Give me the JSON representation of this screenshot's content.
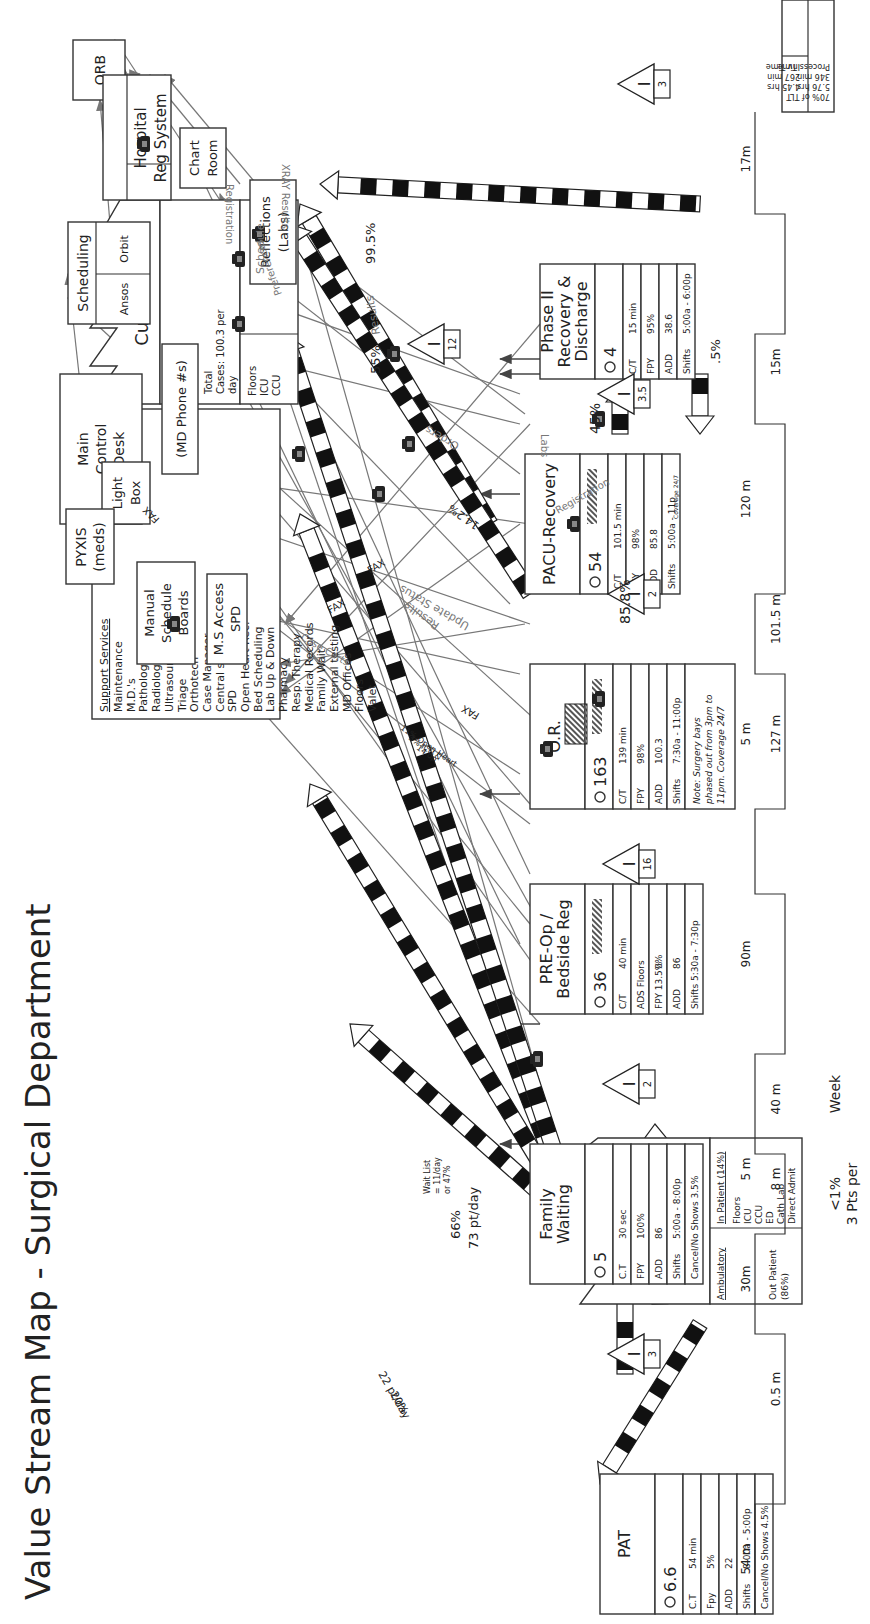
{
  "title": "Value Stream Map - Surgical Department",
  "suppliers": {
    "label": "Suppliers",
    "ambulatory": {
      "heading": "Ambulatory",
      "lines": [
        "Out Patient",
        "(86%)"
      ]
    },
    "inpatient": {
      "heading": "In Patient (14%)",
      "lines": [
        "Floors",
        "ICU",
        "CCU",
        "ED",
        "Cath Lab",
        "Direct Admit"
      ]
    },
    "note_lines": [
      "<1%",
      "3 Pts per",
      "Week"
    ]
  },
  "customer": {
    "label": "Customer",
    "total_lines": [
      "Total",
      "Cases: 100.3 per",
      "day"
    ],
    "home": "Home",
    "floors_lines": [
      "Floors",
      "ICU",
      "CCU"
    ]
  },
  "info_systems": {
    "orb": "ORB",
    "scheduling": "Scheduling",
    "orbit": "Orbit",
    "ansos": "Ansos",
    "main_control_lines": [
      "Main",
      "Control",
      "Desk"
    ],
    "light_box_lines": [
      "Light",
      "Box"
    ],
    "pyxis_lines": [
      "PYXIS",
      "(meds)"
    ],
    "manual_boards_lines": [
      "Manual",
      "Schedule",
      "Boards"
    ],
    "ms_access_lines": [
      "M.S Access",
      "SPD"
    ],
    "md_phone": "(MD Phone #s)",
    "hospital_reg_lines": [
      "Hospital",
      "Reg System"
    ],
    "chart_room_lines": [
      "Chart",
      "Room"
    ],
    "reflections_lines": [
      "Reflections",
      "(Labs)"
    ]
  },
  "support_services": {
    "heading": "Support Services",
    "items": [
      "Maintenance",
      "M.D.'s",
      "Pathology",
      "Radiology",
      "Ultrasound",
      "Triage",
      "Orthotech",
      "Case Manager",
      "Central supply",
      "SPD",
      "Open Heart Rec.",
      "Bed Scheduling",
      "Lab Up & Down",
      "Pharmacy",
      "Resp. Therapy",
      "Medical Records",
      "Family Wait",
      "External testing",
      "MD Offices",
      "Floors",
      "Valet"
    ]
  },
  "flow_labels": {
    "registration_1": "Registration",
    "registration_2": "Registration",
    "xray_results": "XRAY Results",
    "labs": "Labs",
    "preferences": "Preferences",
    "schedule": "Schedule",
    "results_1": "Results",
    "results_2": "Results",
    "orders": "Orders",
    "update_status": "Update Status",
    "case_carts": "Case Carts",
    "fax_1": "FAX",
    "fax_2": "FAX",
    "fax_3": "FAX",
    "fax_4": "FAX",
    "open_heart_note": [
      "11% Open Heart",
      "3% ICU &",
      "14 dp"
    ]
  },
  "material_flow": {
    "pat_pct": "20%",
    "pat_rate": "22 pt/day",
    "family_pct": "66%",
    "family_rate": "73 pt/day",
    "wait_list": [
      "Wait List",
      "= 11/day",
      "or 47%"
    ],
    "or_to_pacu_pct": "85.8%",
    "or_to_customer_pct": "14.2%",
    "pacu_to_phase2_pct": "45%",
    "pacu_to_customer_pct": "55%",
    "phase2_back_pct": ".5%",
    "phase2_to_customer_pct": "99.5%"
  },
  "inventory": [
    {
      "name": "inv-suppliers-pat",
      "value": "3"
    },
    {
      "name": "inv-family-preop",
      "value": "2"
    },
    {
      "name": "inv-preop-or",
      "value": "16"
    },
    {
      "name": "inv-or-pacu",
      "value": "2"
    },
    {
      "name": "inv-pacu-phase2",
      "value": "3.5"
    },
    {
      "name": "inv-pacu-customer",
      "value": "12"
    },
    {
      "name": "inv-phase2-customer",
      "value": "3"
    }
  ],
  "processes": [
    {
      "id": "pat",
      "name_lines": [
        "PAT"
      ],
      "operators": "6.6",
      "rows": [
        [
          "C.T",
          "54 min"
        ],
        [
          "Fpy",
          "5%"
        ],
        [
          "ADD",
          "22"
        ],
        [
          "Shifts",
          "8:00a - 5:00p"
        ],
        [
          "Cancel/No Shows 4.5%",
          ""
        ]
      ]
    },
    {
      "id": "family",
      "name_lines": [
        "Family",
        "Waiting"
      ],
      "operators": "5",
      "rows": [
        [
          "C.T",
          "30 sec"
        ],
        [
          "FPY",
          "100%"
        ],
        [
          "ADD",
          "86"
        ],
        [
          "Shifts",
          "5:00a - 8:00p"
        ],
        [
          "Cancel/No Shows 3.5%",
          ""
        ]
      ]
    },
    {
      "id": "preop",
      "name_lines": [
        "PRE-Op /",
        "Bedside Reg"
      ],
      "operators": "36",
      "rows": [
        [
          "C/T",
          "40 min"
        ],
        [
          "ADS  Floors",
          ""
        ],
        [
          "FPY  13.5%",
          "0%"
        ],
        [
          "ADD",
          "86"
        ],
        [
          "Shifts 5:30a - 7:30p",
          ""
        ]
      ]
    },
    {
      "id": "or",
      "name_lines": [
        "O.R."
      ],
      "operators": "163",
      "rows": [
        [
          "C/T",
          "139 min"
        ],
        [
          "FPY",
          "98%"
        ],
        [
          "ADD",
          "100.3"
        ],
        [
          "Shifts",
          "7:30a - 11:00p"
        ]
      ],
      "note_lines": [
        "Note: Surgery bays",
        "phased out from 3pm to",
        "11pm. Coverage 24/7"
      ]
    },
    {
      "id": "pacu",
      "name_lines": [
        "PACU-Recovery"
      ],
      "operators": "54",
      "rows": [
        [
          "C/T",
          "101.5 min"
        ],
        [
          "FPY",
          "98%"
        ],
        [
          "ADD",
          "85.8"
        ],
        [
          "Shifts",
          "5:00a - 11p"
        ]
      ],
      "coverage": "Coverage 24/7"
    },
    {
      "id": "phase2",
      "name_lines": [
        "Phase II",
        "Recovery &",
        "Discharge"
      ],
      "operators": "4",
      "rows": [
        [
          "C/T",
          "15 min"
        ],
        [
          "FPY",
          "95%"
        ],
        [
          "ADD",
          "38.6"
        ],
        [
          "Shifts",
          "5:00a - 6:00p"
        ]
      ]
    }
  ],
  "timeline": {
    "wait_times": [
      "54 m",
      "30m",
      "5 m",
      "90m",
      "5 m",
      "120 m",
      "17m"
    ],
    "process_times": [
      "0.5 m",
      "8 m",
      "40 m",
      "127 m",
      "101.5 m",
      "15m"
    ],
    "summary": {
      "total_lines": [
        "Total Thru Put Time",
        "613  min",
        "10.2 hrs"
      ],
      "inv_lines": [
        "Inv Time",
        "267 min",
        "4.45 hrs"
      ],
      "process_lines": [
        "Process Time",
        "346  min",
        "5.76 hrs",
        "70% of TLT"
      ]
    }
  }
}
